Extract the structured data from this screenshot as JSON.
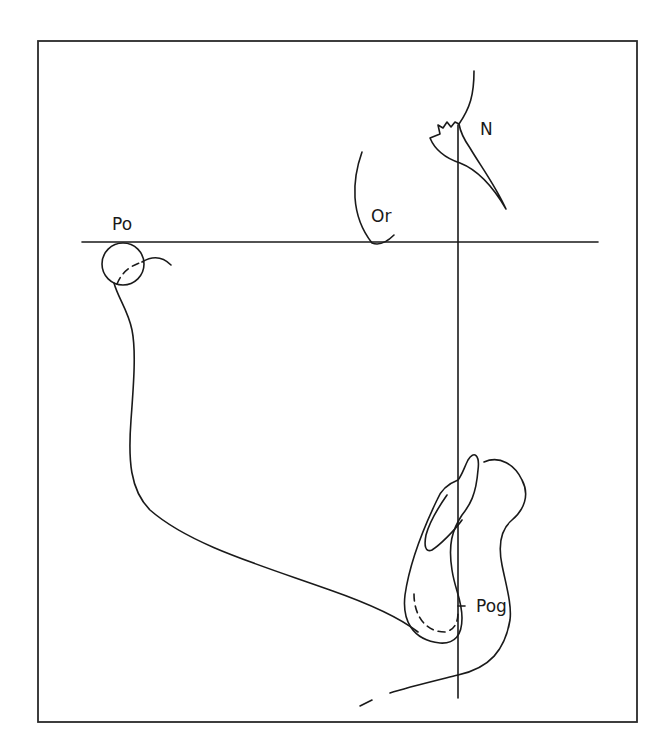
{
  "figure": {
    "type": "cephalometric tracing",
    "background": "#ffffff",
    "line_color": "#1a1a1a",
    "landmarks": [
      {
        "id": "po",
        "label": "Po",
        "x": 112,
        "y": 230
      },
      {
        "id": "or",
        "label": "Or",
        "x": 371,
        "y": 222
      },
      {
        "id": "n",
        "label": "N",
        "x": 480,
        "y": 135
      },
      {
        "id": "pog",
        "label": "Pog",
        "x": 476,
        "y": 612
      }
    ],
    "reference_lines": [
      {
        "name": "frankfort-horizontal",
        "x1": 82,
        "y1": 242,
        "x2": 598,
        "y2": 242
      },
      {
        "name": "nasion-perpendicular",
        "x1": 458,
        "y1": 125,
        "x2": 458,
        "y2": 698
      }
    ]
  }
}
